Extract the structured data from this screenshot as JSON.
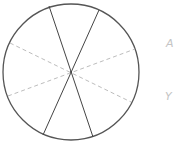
{
  "diagram": {
    "type": "circle-divided-by-diameters",
    "circle": {
      "cx": 71,
      "cy": 72,
      "r": 68,
      "stroke": "#555555"
    },
    "solid_lines": [
      {
        "x1": 49,
        "y1": 6,
        "x2": 93,
        "y2": 137
      },
      {
        "x1": 99,
        "y1": 10,
        "x2": 43,
        "y2": 135
      }
    ],
    "dashed_lines": [
      {
        "x1": 10,
        "y1": 43,
        "x2": 131,
        "y2": 102
      },
      {
        "x1": 8,
        "y1": 96,
        "x2": 135,
        "y2": 49
      }
    ],
    "colors": {
      "solid": "#444444",
      "dashed": "#bdbdbd",
      "label": "#c4c4c4"
    }
  },
  "labels": {
    "a": "A",
    "b": "Y"
  }
}
